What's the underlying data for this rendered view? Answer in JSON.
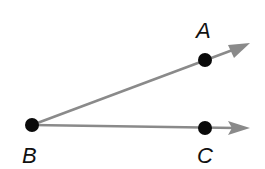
{
  "diagram": {
    "colors": {
      "ray": "#8a8a8a",
      "point": "#0a0a0a",
      "label": "#111111"
    },
    "points": [
      {
        "id": "A",
        "label": "A",
        "x": 205,
        "y": 59
      },
      {
        "id": "B",
        "label": "B",
        "x": 32,
        "y": 125
      },
      {
        "id": "C",
        "label": "C",
        "x": 205,
        "y": 128
      }
    ],
    "rays": [
      {
        "id": "BA",
        "from": "B",
        "through": "A"
      },
      {
        "id": "BC",
        "from": "B",
        "through": "C"
      }
    ]
  }
}
